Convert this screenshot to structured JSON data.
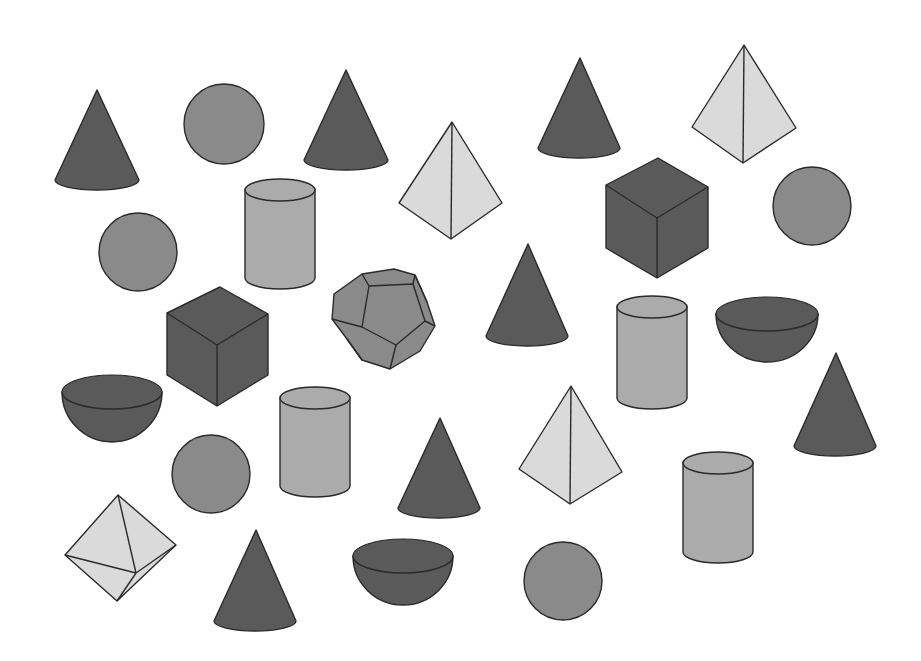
{
  "colors": {
    "background": "#ffffff",
    "dark": "#5a5a5a",
    "medium": "#8a8a8a",
    "light_cylinder": "#ababab",
    "light": "#dadada",
    "stroke": "#2a2a2a"
  },
  "shapes": [
    {
      "type": "cone",
      "id": "cone-1",
      "apex": [
        97,
        90
      ],
      "base_cx": 97,
      "base_cy": 180,
      "rx": 42,
      "ry": 10
    },
    {
      "type": "sphere",
      "id": "sphere-1",
      "cx": 224,
      "cy": 124,
      "r": 40
    },
    {
      "type": "cone",
      "id": "cone-2",
      "apex": [
        346,
        70
      ],
      "base_cx": 346,
      "base_cy": 160,
      "rx": 42,
      "ry": 10
    },
    {
      "type": "cone",
      "id": "cone-3",
      "apex": [
        580,
        58
      ],
      "base_cx": 579,
      "base_cy": 148,
      "rx": 41,
      "ry": 10
    },
    {
      "type": "tetrahedron",
      "id": "tetrahedron-1",
      "apex": [
        744,
        45
      ],
      "left": [
        692,
        127
      ],
      "right": [
        796,
        128
      ],
      "bottom": [
        743,
        163
      ]
    },
    {
      "type": "tetrahedron",
      "id": "tetrahedron-2",
      "apex": [
        452,
        122
      ],
      "left": [
        399,
        203
      ],
      "right": [
        502,
        203
      ],
      "bottom": [
        451,
        239
      ]
    },
    {
      "type": "cylinder",
      "id": "cylinder-1",
      "cx": 280,
      "top": 190,
      "bottom": 278,
      "rx": 35,
      "ry": 11
    },
    {
      "type": "cube",
      "id": "cube-1",
      "top": [
        658,
        158
      ],
      "left": [
        606,
        185
      ],
      "right": [
        708,
        187
      ],
      "center": [
        657,
        218
      ],
      "bl": [
        606,
        248
      ],
      "br": [
        708,
        248
      ],
      "bottom": [
        657,
        278
      ]
    },
    {
      "type": "sphere",
      "id": "sphere-2",
      "cx": 812,
      "cy": 206,
      "r": 39
    },
    {
      "type": "sphere",
      "id": "sphere-3",
      "cx": 138,
      "cy": 252,
      "r": 39
    },
    {
      "type": "dodecahedron",
      "id": "dodecahedron-1",
      "cx": 383,
      "cy": 317
    },
    {
      "type": "cone",
      "id": "cone-4",
      "apex": [
        528,
        244
      ],
      "base_cx": 527,
      "base_cy": 336,
      "rx": 41,
      "ry": 10
    },
    {
      "type": "cube",
      "id": "cube-2",
      "top": [
        220,
        287
      ],
      "left": [
        167,
        313
      ],
      "right": [
        268,
        314
      ],
      "center": [
        217,
        345
      ],
      "bl": [
        167,
        375
      ],
      "br": [
        268,
        375
      ],
      "bottom": [
        217,
        406
      ]
    },
    {
      "type": "cylinder",
      "id": "cylinder-2",
      "cx": 652,
      "top": 307,
      "bottom": 398,
      "rx": 35,
      "ry": 11
    },
    {
      "type": "hemisphere",
      "id": "hemisphere-1",
      "cx": 767,
      "cy": 314,
      "rx": 51,
      "ry": 17,
      "depth": 48
    },
    {
      "type": "hemisphere",
      "id": "hemisphere-2",
      "cx": 112,
      "cy": 392,
      "rx": 50,
      "ry": 17,
      "depth": 50
    },
    {
      "type": "cylinder",
      "id": "cylinder-3",
      "cx": 315,
      "top": 398,
      "bottom": 486,
      "rx": 35,
      "ry": 11
    },
    {
      "type": "sphere",
      "id": "sphere-4",
      "cx": 211,
      "cy": 474,
      "r": 39
    },
    {
      "type": "cone",
      "id": "cone-5",
      "apex": [
        440,
        418
      ],
      "base_cx": 439,
      "base_cy": 508,
      "rx": 41,
      "ry": 10
    },
    {
      "type": "tetrahedron",
      "id": "tetrahedron-3",
      "apex": [
        571,
        386
      ],
      "left": [
        519,
        469
      ],
      "right": [
        622,
        472
      ],
      "bottom": [
        570,
        504
      ]
    },
    {
      "type": "cone",
      "id": "cone-6",
      "apex": [
        836,
        353
      ],
      "base_cx": 835,
      "base_cy": 446,
      "rx": 41,
      "ry": 10
    },
    {
      "type": "cylinder",
      "id": "cylinder-4",
      "cx": 718,
      "top": 463,
      "bottom": 552,
      "rx": 35,
      "ry": 11
    },
    {
      "type": "octahedron",
      "id": "octahedron-1",
      "top": [
        118,
        495
      ],
      "left": [
        65,
        555
      ],
      "right": [
        176,
        545
      ],
      "bottom": [
        117,
        601
      ],
      "inner": [
        136,
        573
      ]
    },
    {
      "type": "cone",
      "id": "cone-7",
      "apex": [
        256,
        530
      ],
      "base_cx": 255,
      "base_cy": 621,
      "rx": 41,
      "ry": 10
    },
    {
      "type": "hemisphere",
      "id": "hemisphere-3",
      "cx": 403,
      "cy": 556,
      "rx": 50,
      "ry": 17,
      "depth": 49
    },
    {
      "type": "sphere",
      "id": "sphere-5",
      "cx": 563,
      "cy": 581,
      "r": 39
    }
  ]
}
